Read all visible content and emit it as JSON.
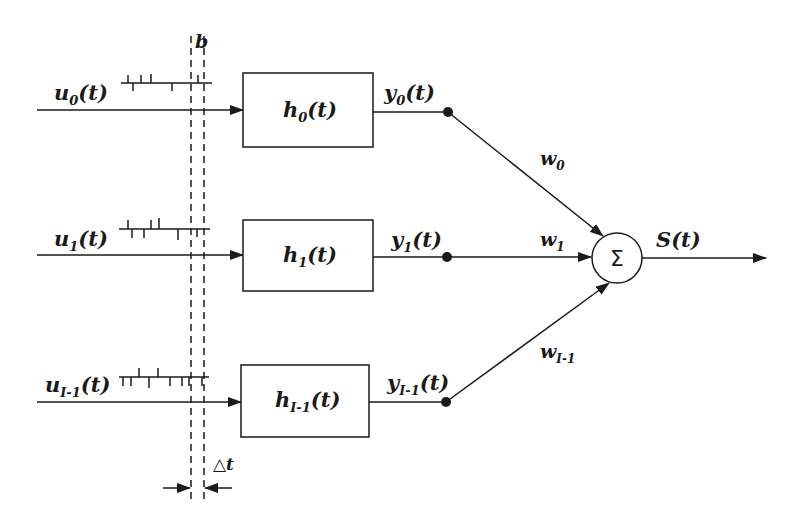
{
  "diagram": {
    "type": "neural-filter-summation",
    "colors": {
      "ink": "#1a1a1a",
      "background": "#ffffff"
    },
    "window_label": "b",
    "delta_label": "△t",
    "channels": [
      {
        "input": {
          "base": "u",
          "sub": "0",
          "suffix": "(t)"
        },
        "filter": {
          "base": "h",
          "sub": "0",
          "suffix": "(t)"
        },
        "output": {
          "base": "y",
          "sub": "0",
          "suffix": "(t)"
        },
        "weight": {
          "base": "w",
          "sub": "0"
        }
      },
      {
        "input": {
          "base": "u",
          "sub": "1",
          "suffix": "(t)"
        },
        "filter": {
          "base": "h",
          "sub": "1",
          "suffix": "(t)"
        },
        "output": {
          "base": "y",
          "sub": "1",
          "suffix": "(t)"
        },
        "weight": {
          "base": "w",
          "sub": "1"
        }
      },
      {
        "input": {
          "base": "u",
          "sub": "I-1",
          "suffix": "(t)"
        },
        "filter": {
          "base": "h",
          "sub": "I-1",
          "suffix": "(t)"
        },
        "output": {
          "base": "y",
          "sub": "I-1",
          "suffix": "(t)"
        },
        "weight": {
          "base": "w",
          "sub": "I-1"
        }
      }
    ],
    "summation": {
      "symbol": "Σ"
    },
    "output": {
      "label": "S(t)"
    }
  }
}
